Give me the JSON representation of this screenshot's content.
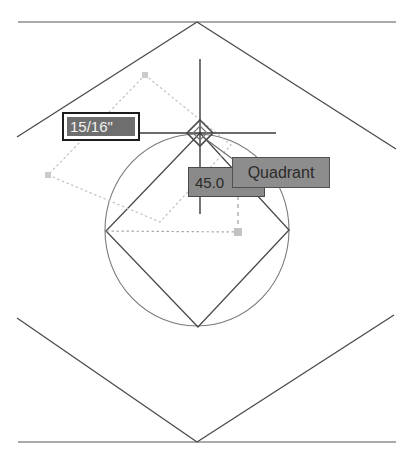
{
  "app": {
    "title": "CAD drawing area",
    "background_color": "#ffffff"
  },
  "drawing": {
    "geometry_color": "#4a4a4a",
    "construction_color": "#b9b9b9",
    "crosshair_color": "#3a3a3a",
    "marker_color": "#c2c2c2",
    "description": "Rotated square inscribed in a circle, inside a large diamond bounded by two horizontal reference lines",
    "outer_top_line_label": "top-reference-line",
    "outer_bottom_line_label": "bottom-reference-line",
    "diamond_label": "outer-diamond-outline",
    "circle_label": "construction-circle",
    "square_label": "inscribed-square",
    "construction_square_label": "dotted-construction-square",
    "tracking_line_label": "polar-tracking-line"
  },
  "cursor": {
    "marker_type": "quadrant-osnap-diamond",
    "x": 200,
    "y": 133
  },
  "dimension_input": {
    "value": "15/16\"",
    "placeholder": "length",
    "field_color": "#6e6e6e",
    "text_color": "#f2f2f2"
  },
  "angle_input": {
    "value": "45.0",
    "placeholder": "angle",
    "field_color": "#8a8a8a",
    "text_color": "#2a2a2a"
  },
  "osnap_tooltip": {
    "label": "Quadrant",
    "fill_color": "#8d8d8d",
    "text_color": "#2b2b2b"
  }
}
